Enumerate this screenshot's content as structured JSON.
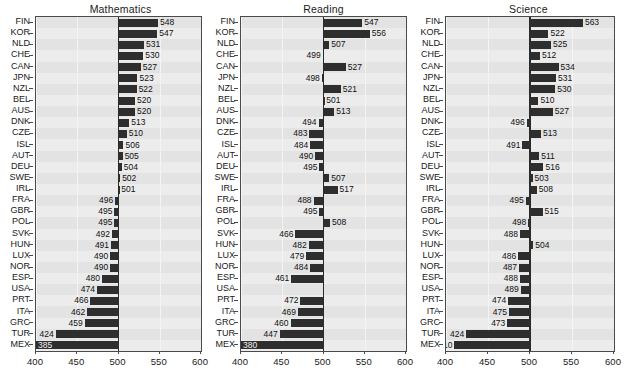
{
  "chart_data": [
    {
      "type": "bar",
      "title": "Mathematics",
      "xlabel": "",
      "ylabel": "",
      "orientation": "horizontal",
      "baseline": 500,
      "xlim": [
        400,
        600
      ],
      "xticks": [
        400,
        450,
        500,
        550,
        600
      ],
      "grid": true,
      "legend": "none",
      "categories": [
        "FIN",
        "KOR",
        "NLD",
        "CHE",
        "CAN",
        "JPN",
        "NZL",
        "BEL",
        "AUS",
        "DNK",
        "CZE",
        "ISL",
        "AUT",
        "DEU",
        "SWE",
        "IRL",
        "FRA",
        "GBR",
        "POL",
        "SVK",
        "HUN",
        "LUX",
        "NOR",
        "ESP",
        "USA",
        "PRT",
        "ITA",
        "GRC",
        "TUR",
        "MEX"
      ],
      "values": [
        548,
        547,
        531,
        530,
        527,
        523,
        522,
        520,
        520,
        513,
        510,
        506,
        505,
        504,
        502,
        501,
        496,
        495,
        495,
        492,
        491,
        490,
        490,
        480,
        474,
        466,
        462,
        459,
        424,
        385
      ],
      "labels": [
        "548",
        "547",
        "531",
        "530",
        "527",
        "523",
        "522",
        "520",
        "520",
        "513",
        "510",
        "506",
        "505",
        "504",
        "502",
        "501",
        "496",
        "495",
        "495",
        "492",
        "491",
        "490",
        "490",
        "480",
        "474",
        "466",
        "462",
        "459",
        "424",
        "385"
      ]
    },
    {
      "type": "bar",
      "title": "Reading",
      "xlabel": "",
      "ylabel": "",
      "orientation": "horizontal",
      "baseline": 500,
      "xlim": [
        400,
        600
      ],
      "xticks": [
        400,
        450,
        500,
        550,
        600
      ],
      "grid": true,
      "legend": "none",
      "categories": [
        "FIN",
        "KOR",
        "NLD",
        "CHE",
        "CAN",
        "JPN",
        "NZL",
        "BEL",
        "AUS",
        "DNK",
        "CZE",
        "ISL",
        "AUT",
        "DEU",
        "SWE",
        "IRL",
        "FRA",
        "GBR",
        "POL",
        "SVK",
        "HUN",
        "LUX",
        "NOR",
        "ESP",
        "USA",
        "PRT",
        "ITA",
        "GRC",
        "TUR",
        "MEX"
      ],
      "values": [
        547,
        556,
        507,
        499,
        527,
        498,
        521,
        501,
        513,
        494,
        483,
        484,
        490,
        495,
        507,
        517,
        488,
        495,
        508,
        466,
        482,
        479,
        484,
        461,
        null,
        472,
        469,
        460,
        447,
        380
      ],
      "labels": [
        "547",
        "556",
        "507",
        "499",
        "527",
        "498",
        "521",
        "501",
        "513",
        "494",
        "483",
        "484",
        "490",
        "495",
        "507",
        "517",
        "488",
        "495",
        "508",
        "466",
        "482",
        "479",
        "484",
        "461",
        "",
        "472",
        "469",
        "460",
        "447",
        "380"
      ]
    },
    {
      "type": "bar",
      "title": "Science",
      "xlabel": "",
      "ylabel": "",
      "orientation": "horizontal",
      "baseline": 500,
      "xlim": [
        400,
        600
      ],
      "xticks": [
        400,
        450,
        500,
        550,
        600
      ],
      "grid": true,
      "legend": "none",
      "categories": [
        "FIN",
        "KOR",
        "NLD",
        "CHE",
        "CAN",
        "JPN",
        "NZL",
        "BEL",
        "AUS",
        "DNK",
        "CZE",
        "ISL",
        "AUT",
        "DEU",
        "SWE",
        "IRL",
        "FRA",
        "GBR",
        "POL",
        "SVK",
        "HUN",
        "LUX",
        "NOR",
        "ESP",
        "USA",
        "PRT",
        "ITA",
        "GRC",
        "TUR",
        "MEX"
      ],
      "values": [
        563,
        522,
        525,
        512,
        534,
        531,
        530,
        510,
        527,
        496,
        513,
        491,
        511,
        516,
        503,
        508,
        495,
        515,
        498,
        488,
        504,
        486,
        487,
        488,
        489,
        474,
        475,
        473,
        424,
        410
      ],
      "labels": [
        "563",
        "522",
        "525",
        "512",
        "534",
        "531",
        "530",
        "510",
        "527",
        "496",
        "513",
        "491",
        "511",
        "516",
        "503",
        "508",
        "495",
        "515",
        "498",
        "488",
        "504",
        "486",
        "487",
        "488",
        "489",
        "474",
        "475",
        "473",
        "424",
        "410"
      ]
    }
  ],
  "panels": [
    {
      "title": "Mathematics"
    },
    {
      "title": "Reading"
    },
    {
      "title": "Science"
    }
  ],
  "colors": {
    "bar": "#2e2e2e",
    "plot_background": "#e9e9e9",
    "stripe": "#e3e3e3",
    "stripe_alt": "#ececec",
    "axis": "#4a4a4a",
    "baseline": "#2b2b2b",
    "text": "#111111"
  }
}
